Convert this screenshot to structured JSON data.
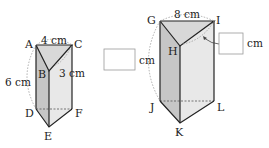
{
  "prism_small": {
    "vertices": {
      "A": "A",
      "B": "B",
      "C": "C",
      "D": "D",
      "E": "E",
      "F": "F"
    },
    "dims": {
      "top": "4 cm",
      "side": "3 cm",
      "height": "6 cm"
    }
  },
  "prism_large": {
    "vertices": {
      "G": "G",
      "H": "H",
      "I": "I",
      "J": "J",
      "K": "K",
      "L": "L"
    },
    "dims": {
      "top": "8 cm",
      "height_unit": "cm",
      "side_unit": "cm"
    },
    "answer_boxes": {
      "height": "",
      "side": ""
    }
  },
  "colors": {
    "line": "#222222",
    "top_face": "#dcdcdc",
    "left_face": "#c8c8c8",
    "right_face": "#e6e6e6",
    "dashed": "#888888",
    "box_border": "#999999"
  }
}
